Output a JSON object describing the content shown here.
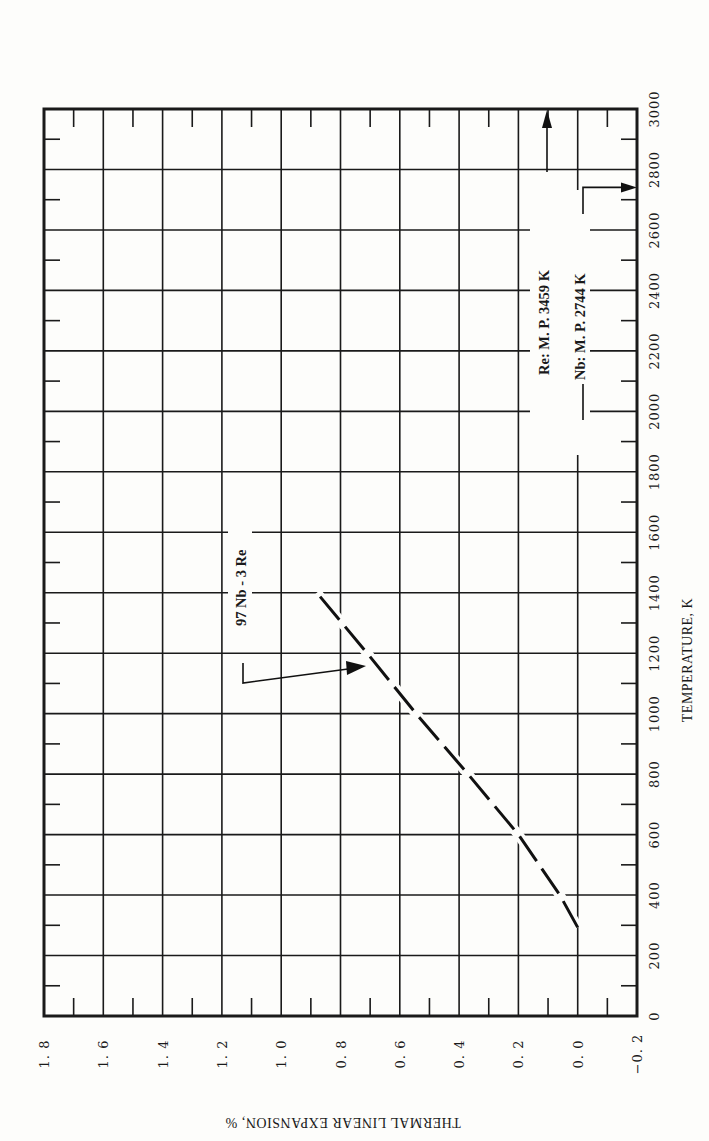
{
  "chart_data": {
    "type": "line",
    "title": "",
    "xlabel": "TEMPERATURE, K",
    "ylabel": "THERMAL LINEAR EXPANSION, %",
    "xlim": [
      0,
      3000
    ],
    "ylim": [
      -0.2,
      1.8
    ],
    "x_ticks": [
      0,
      200,
      400,
      600,
      800,
      1000,
      1200,
      1400,
      1600,
      1800,
      2000,
      2200,
      2400,
      2600,
      2800,
      3000
    ],
    "y_ticks": [
      -0.2,
      0.0,
      0.2,
      0.4,
      0.6,
      0.8,
      1.0,
      1.2,
      1.4,
      1.6,
      1.8
    ],
    "x_tick_labels": [
      "0",
      "200",
      "400",
      "600",
      "800",
      "1000",
      "1200",
      "1400",
      "1600",
      "1800",
      "2000",
      "2200",
      "2400",
      "2600",
      "2800",
      "3000"
    ],
    "y_tick_labels": [
      "-0.2",
      "0.0",
      "0.2",
      "0.4",
      "0.6",
      "0.8",
      "1.0",
      "1.2",
      "1.4",
      "1.6",
      "1.8"
    ],
    "grid": true,
    "orientation": "rotated 90 degrees: temperature axis runs vertically (bottom to top) on the right, expansion axis runs horizontally (right to left) along the bottom",
    "series": [
      {
        "name": "97 Nb - 3 Re",
        "style": "dashed",
        "x": [
          293,
          400,
          600,
          800,
          1000,
          1200,
          1400
        ],
        "y": [
          0.0,
          0.06,
          0.2,
          0.37,
          0.545,
          0.71,
          0.88
        ]
      }
    ],
    "annotations": [
      {
        "text": "97 Nb - 3 Re",
        "points_to": "series curve near T=1150 K"
      },
      {
        "text": "Re:  M. P.  3459 K",
        "arrow": "up, off chart (beyond 3000 K)"
      },
      {
        "text": "Nb:  M. P.  2744 K",
        "arrow": "points to 2744 K on temperature axis"
      }
    ],
    "melting_points": [
      {
        "element": "Re",
        "value_K": 3459
      },
      {
        "element": "Nb",
        "value_K": 2744
      }
    ]
  },
  "labels": {
    "x_axis_title": "TEMPERATURE, K",
    "y_axis_title": "THERMAL LINEAR EXPANSION, %",
    "series_label": "97 Nb - 3 Re",
    "re_mp": "Re:  M. P.  3459 K",
    "nb_mp": "Nb:  M. P.  2744 K"
  }
}
